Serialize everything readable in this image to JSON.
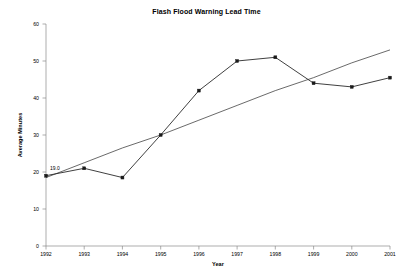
{
  "chart_data": {
    "type": "line",
    "title": "Flash Flood Warning Lead Time",
    "xlabel": "Year",
    "ylabel": "Average Minutes",
    "categories": [
      "1992",
      "1993",
      "1994",
      "1995",
      "1996",
      "1997",
      "1998",
      "1999",
      "2000",
      "2001"
    ],
    "x": [
      1992,
      1993,
      1994,
      1995,
      1996,
      1997,
      1998,
      1999,
      2000,
      2001
    ],
    "series": [
      {
        "name": "Average Minutes",
        "values": [
          19,
          21,
          18.5,
          30,
          42,
          50,
          51,
          44,
          43,
          45.5
        ]
      },
      {
        "name": "Linear trend",
        "values": [
          18.5,
          22.5,
          26.5,
          30,
          34,
          38,
          42,
          45.5,
          49.5,
          53
        ]
      }
    ],
    "annotations": [
      {
        "label": "19.0",
        "x": 1992,
        "y": 19
      }
    ],
    "ylim": [
      0,
      60
    ],
    "yticks": [
      0,
      10,
      20,
      30,
      40,
      50,
      60
    ],
    "ytick_labels": [
      "0",
      "10",
      "20",
      "30",
      "40",
      "50",
      "60"
    ],
    "xtick_labels": [
      "1992",
      "1993",
      "1994",
      "1995",
      "1996",
      "1997",
      "1998",
      "1999",
      "2000",
      "2001"
    ],
    "grid": false,
    "legend": "none",
    "colors": {
      "data_line": "#2a2a2a",
      "trend_line": "#2a2a2a",
      "axis": "#8a8a8a",
      "text": "#000000",
      "background": "#ffffff"
    }
  }
}
